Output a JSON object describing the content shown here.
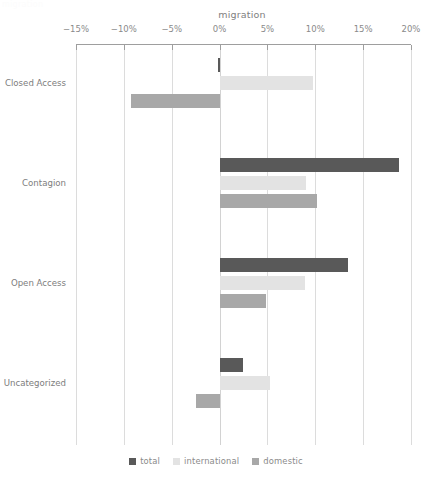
{
  "ghost_text": "migration",
  "chart_data": {
    "type": "bar",
    "orientation": "horizontal",
    "title": "migration",
    "xlabel": "",
    "ylabel": "",
    "xlim": [
      -15,
      20
    ],
    "xticks": [
      -15,
      -10,
      -5,
      0,
      5,
      10,
      15,
      20
    ],
    "xtick_labels": [
      "−15%",
      "−10%",
      "−5%",
      "0%",
      "5%",
      "10%",
      "15%",
      "20%"
    ],
    "categories": [
      "Closed Access",
      "Contagion",
      "Open Access",
      "Uncategorized"
    ],
    "grid": true,
    "grid_axis": "x",
    "legend_position": "bottom",
    "series": [
      {
        "name": "total",
        "color": "#595959",
        "values": [
          -0.2,
          18.7,
          13.4,
          2.4
        ]
      },
      {
        "name": "international",
        "color": "#e3e3e3",
        "values": [
          9.8,
          9.0,
          8.9,
          5.3
        ]
      },
      {
        "name": "domestic",
        "color": "#a8a8a8",
        "values": [
          -9.3,
          10.2,
          4.8,
          -2.5
        ]
      }
    ]
  }
}
